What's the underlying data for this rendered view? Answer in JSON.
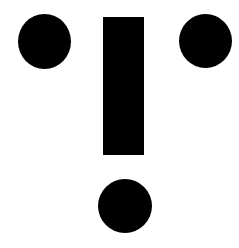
{
  "figure": {
    "background_color": "#ffffff",
    "fill_color": "#000000",
    "shapes": [
      {
        "name": "circle-left",
        "type": "circle",
        "cx": 44,
        "cy": 41,
        "r": 26
      },
      {
        "name": "bar",
        "type": "rect",
        "x": 103,
        "y": 17,
        "width": 41,
        "height": 138
      },
      {
        "name": "circle-right",
        "type": "circle",
        "cx": 205,
        "cy": 41,
        "r": 26
      },
      {
        "name": "circle-bottom",
        "type": "circle",
        "cx": 125,
        "cy": 206,
        "r": 27
      }
    ]
  }
}
